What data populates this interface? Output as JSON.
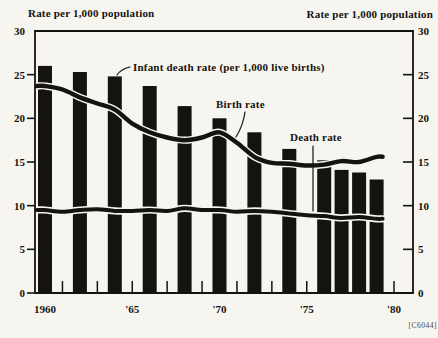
{
  "titles": {
    "left": "Rate per 1,000 population",
    "right": "Rate per 1,000 population"
  },
  "annotations": {
    "infant": "Infant death rate (per 1,000 live births)",
    "birth": "Birth rate",
    "death": "Death rate"
  },
  "corner_code": "[C6044]",
  "colors": {
    "ink": "#151311",
    "paper": "#f7f5ef"
  },
  "chart_data": {
    "type": "bar",
    "title": "Rate per 1,000 population",
    "ylabel_left": "Rate per 1,000 population",
    "ylabel_right": "Rate per 1,000 population",
    "ylim": [
      0,
      30
    ],
    "y_ticks": [
      0,
      5,
      10,
      15,
      20,
      25,
      30
    ],
    "grid": false,
    "x_range_years": [
      1960,
      1980
    ],
    "x_minor_tick_years": [
      1961,
      1963,
      1965,
      1967,
      1969,
      1971,
      1973,
      1975,
      1980
    ],
    "x_labels": [
      {
        "year": 1960,
        "text": "1960"
      },
      {
        "year": 1965,
        "text": "'65"
      },
      {
        "year": 1970,
        "text": "'70"
      },
      {
        "year": 1975,
        "text": "'75"
      },
      {
        "year": 1980,
        "text": "'80"
      }
    ],
    "bars": {
      "name": "Infant death rate (per 1,000 live births)",
      "years": [
        1960,
        1962,
        1964,
        1966,
        1968,
        1970,
        1972,
        1974,
        1976,
        1977,
        1978,
        1979
      ],
      "values": [
        26.0,
        25.3,
        24.8,
        23.7,
        21.4,
        20.0,
        18.4,
        16.5,
        15.2,
        14.1,
        13.8,
        13.0
      ]
    },
    "lines": [
      {
        "name": "Birth rate",
        "years": [
          1960,
          1961,
          1962,
          1963,
          1964,
          1965,
          1966,
          1967,
          1968,
          1969,
          1970,
          1971,
          1972,
          1973,
          1974,
          1975,
          1976,
          1977,
          1978,
          1979
        ],
        "values": [
          23.7,
          23.3,
          22.4,
          21.7,
          21.0,
          19.4,
          18.4,
          17.8,
          17.5,
          17.8,
          18.4,
          17.2,
          15.6,
          14.9,
          14.8,
          14.6,
          14.7,
          15.1,
          15.0,
          15.6
        ]
      },
      {
        "name": "Death rate",
        "years": [
          1960,
          1961,
          1962,
          1963,
          1964,
          1965,
          1966,
          1967,
          1968,
          1969,
          1970,
          1971,
          1972,
          1973,
          1974,
          1975,
          1976,
          1977,
          1978,
          1979
        ],
        "values": [
          9.5,
          9.3,
          9.5,
          9.6,
          9.4,
          9.4,
          9.5,
          9.4,
          9.7,
          9.5,
          9.5,
          9.3,
          9.4,
          9.3,
          9.1,
          8.9,
          8.8,
          8.6,
          8.7,
          8.5
        ]
      }
    ]
  }
}
